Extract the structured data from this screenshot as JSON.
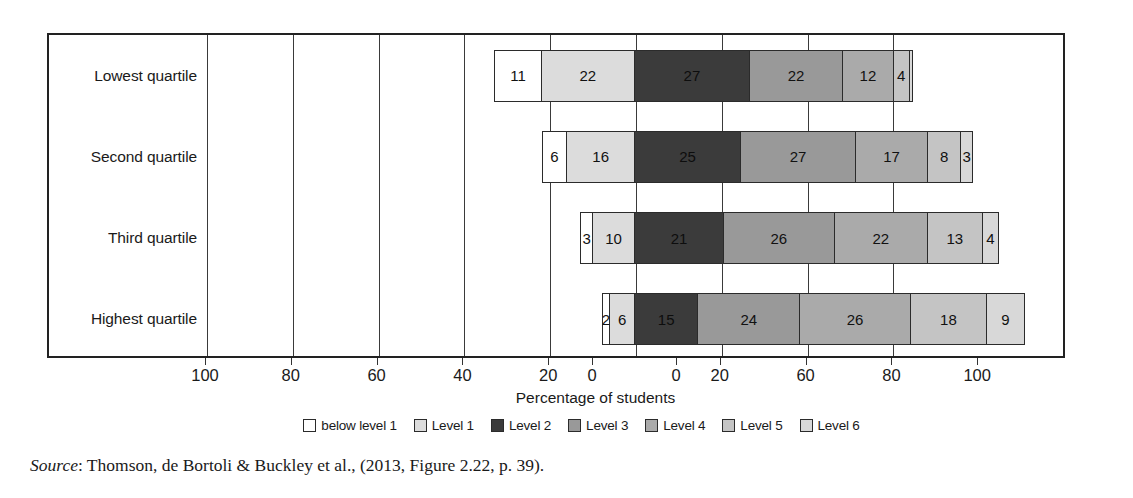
{
  "chart_data": {
    "type": "bar",
    "subtype": "diverging-stacked-horizontal",
    "title": "",
    "xlabel": "Percentage of students",
    "ylabel": "",
    "categories": [
      "Lowest quartile",
      "Second quartile",
      "Third quartile",
      "Highest quartile"
    ],
    "series": [
      {
        "name": "below level 1",
        "values": [
          11,
          6,
          3,
          2
        ]
      },
      {
        "name": "Level 1",
        "values": [
          22,
          16,
          10,
          6
        ]
      },
      {
        "name": "Level 2",
        "values": [
          27,
          25,
          21,
          15
        ]
      },
      {
        "name": "Level 3",
        "values": [
          22,
          27,
          26,
          24
        ]
      },
      {
        "name": "Level 4",
        "values": [
          12,
          17,
          22,
          26
        ]
      },
      {
        "name": "Level 5",
        "values": [
          4,
          8,
          13,
          18
        ]
      },
      {
        "name": "Level 6",
        "values": [
          1,
          3,
          4,
          9
        ]
      }
    ],
    "negative_series": [
      "below level 1",
      "Level 1"
    ],
    "xticks_left": [
      "100",
      "80",
      "60",
      "40",
      "20",
      "0"
    ],
    "xticks_right": [
      "0",
      "20",
      "60",
      "80",
      "100"
    ],
    "xlim": [
      -100,
      100
    ],
    "grid": true,
    "legend_position": "bottom",
    "colors": {
      "below level 1": "#ffffff",
      "Level 1": "#dcdcdc",
      "Level 2": "#3b3b3b",
      "Level 3": "#999999",
      "Level 4": "#aaaaaa",
      "Level 5": "#c4c4c4",
      "Level 6": "#d8d8d8",
      "border": "#2b2b2b",
      "axis": "#222222",
      "text": "#1a1a1a"
    },
    "bar_labels": {
      "Lowest quartile": [
        "11",
        "22",
        "27",
        "22",
        "12",
        "4",
        ""
      ],
      "Second quartile": [
        "6",
        "16",
        "25",
        "27",
        "17",
        "8",
        "3"
      ],
      "Third quartile": [
        "3",
        "10",
        "21",
        "26",
        "22",
        "13",
        "4"
      ],
      "Highest quartile": [
        "2",
        "6",
        "15",
        "24",
        "26",
        "18",
        "9"
      ]
    }
  },
  "axis": {
    "title": "Percentage of students",
    "ticks": [
      {
        "label": "100",
        "pos": -100
      },
      {
        "label": "80",
        "pos": -80
      },
      {
        "label": "60",
        "pos": -60
      },
      {
        "label": "40",
        "pos": -40
      },
      {
        "label": "20",
        "pos": -20
      },
      {
        "label": "0",
        "pos": 0
      },
      {
        "label": "0",
        "pos": 0.001
      },
      {
        "label": "20",
        "pos": 20
      },
      {
        "label": "60",
        "pos": 40
      },
      {
        "label": "80",
        "pos": 60
      },
      {
        "label": "100",
        "pos": 80
      }
    ]
  },
  "legend": {
    "items": [
      {
        "label": "below level 1",
        "color": "#ffffff"
      },
      {
        "label": "Level 1",
        "color": "#dcdcdc"
      },
      {
        "label": "Level 2",
        "color": "#3b3b3b"
      },
      {
        "label": "Level 3",
        "color": "#999999"
      },
      {
        "label": "Level 4",
        "color": "#aaaaaa"
      },
      {
        "label": "Level 5",
        "color": "#c4c4c4"
      },
      {
        "label": "Level 6",
        "color": "#d8d8d8"
      }
    ]
  },
  "source": {
    "prefix": "Source",
    "text": ": Thomson, de Bortoli & Buckley et al., (2013, Figure 2.22, p. 39)."
  }
}
